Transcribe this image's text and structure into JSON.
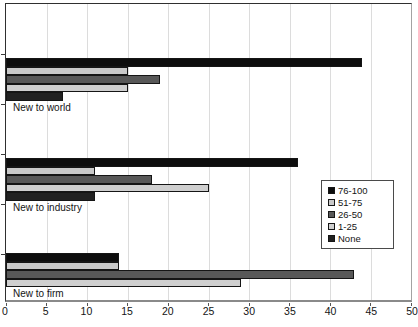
{
  "chart_data": {
    "type": "bar",
    "orientation": "horizontal",
    "title": "",
    "categories": [
      "New to world",
      "New to industry",
      "New to firm"
    ],
    "series": [
      {
        "name": "76-100",
        "color": "#0d0d0d",
        "values": [
          44,
          36,
          14
        ]
      },
      {
        "name": "51-75",
        "color": "#c9c9c9",
        "values": [
          15,
          11,
          14
        ]
      },
      {
        "name": "26-50",
        "color": "#585858",
        "values": [
          19,
          18,
          43
        ]
      },
      {
        "name": "1-25",
        "color": "#cfcfcf",
        "values": [
          15,
          25,
          29
        ]
      },
      {
        "name": "None",
        "color": "#212121",
        "values": [
          7,
          11,
          0
        ]
      }
    ],
    "xlim": [
      0,
      50
    ],
    "x_ticks": [
      0,
      5,
      10,
      15,
      20,
      25,
      30,
      35,
      40,
      45,
      50
    ],
    "grid": "vertical-only",
    "gridline_color": "#dcdcdc",
    "legend_position": "inside-right",
    "legend_entries": [
      "76-100",
      "51-75",
      "26-50",
      "1-25",
      "None"
    ]
  }
}
